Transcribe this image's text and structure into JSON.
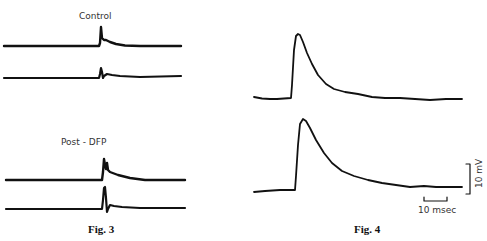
{
  "figures": [
    {
      "caption": "Fig. 3",
      "panels": [
        {
          "label": "Control",
          "traces": [
            "control-trace-1",
            "control-trace-2"
          ]
        },
        {
          "label": "Post - DFP",
          "traces": [
            "post-dfp-trace-1",
            "post-dfp-trace-2"
          ]
        }
      ]
    },
    {
      "caption": "Fig. 4",
      "traces": [
        "fig4-trace-1",
        "fig4-trace-2"
      ],
      "scale_bars": {
        "voltage": "10 mV",
        "time": "10 msec"
      }
    }
  ],
  "colors": {
    "trace": "#111111",
    "background": "#ffffff"
  }
}
